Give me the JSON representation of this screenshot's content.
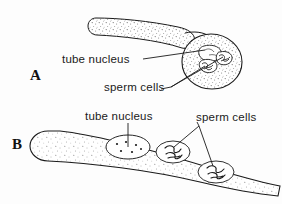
{
  "figure": {
    "background_color": "#fdfdfd",
    "ink_color": "#1a1a1a",
    "stipple_color": "#555555",
    "width": 282,
    "height": 204
  },
  "panels": [
    {
      "id": "A",
      "letter": "A",
      "description": "germinated pollen grain with pollen tube",
      "labels": [
        {
          "id": "tube-nucleus",
          "text": "tube nucleus"
        },
        {
          "id": "sperm-cells",
          "text": "sperm cells"
        }
      ]
    },
    {
      "id": "B",
      "letter": "B",
      "description": "pollen tube interior with tube nucleus and two sperm cells",
      "labels": [
        {
          "id": "tube-nucleus",
          "text": "tube nucleus"
        },
        {
          "id": "sperm-cells",
          "text": "sperm cells"
        }
      ]
    }
  ],
  "panel_a": {
    "letter": "A",
    "tube_nucleus_label": "tube nucleus",
    "sperm_cells_label": "sperm cells"
  },
  "panel_b": {
    "letter": "B",
    "tube_nucleus_label": "tube nucleus",
    "sperm_cells_label": "sperm cells"
  }
}
